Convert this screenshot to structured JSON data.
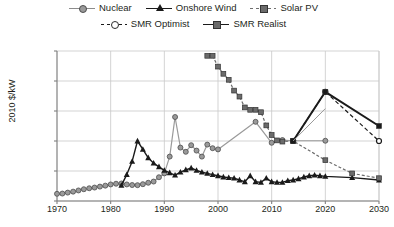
{
  "legend": {
    "rows": [
      [
        {
          "label": "Nuclear",
          "marker": "circle",
          "line": "solid-gray",
          "icon": "nuclear-series-swatch"
        },
        {
          "label": "Onshore Wind",
          "marker": "triangle",
          "line": "solid-black",
          "icon": "onshore-wind-series-swatch"
        },
        {
          "label": "Solar PV",
          "marker": "square",
          "line": "dash-gray",
          "icon": "solar-pv-series-swatch"
        }
      ],
      [
        {
          "label": "SMR Optimist",
          "marker": "circle-open",
          "line": "dash-black",
          "icon": "smr-optimist-series-swatch"
        },
        {
          "label": "SMR Realist",
          "marker": "square",
          "line": "solid-black",
          "icon": "smr-realist-series-swatch"
        }
      ]
    ]
  },
  "axes": {
    "ylabel": "2010 $/kW",
    "yticks": [
      "$0",
      "$2,500",
      "$5,000",
      "$7,500",
      "$10,000",
      "$12,500"
    ],
    "ytick_values": [
      0,
      2500,
      5000,
      7500,
      10000,
      12500
    ],
    "xticks": [
      "1970",
      "1980",
      "1990",
      "2000",
      "2010",
      "2020",
      "2030"
    ],
    "xtick_values": [
      1970,
      1980,
      1990,
      2000,
      2010,
      2020,
      2030
    ]
  },
  "colors": {
    "nuclear": "#9a9a9a",
    "onshore_wind": "#1a1a1a",
    "solar_pv": "#6b6b6b",
    "smr_optimist": "#1a1a1a",
    "smr_realist": "#1a1a1a",
    "grid": "#c8c8c8",
    "axis": "#808080",
    "text": "#231f20",
    "background": "#ffffff"
  },
  "chart_data": {
    "type": "line",
    "title": "",
    "xlabel": "",
    "ylabel": "2010 $/kW",
    "xlim": [
      1970,
      2030
    ],
    "ylim": [
      0,
      12500
    ],
    "grid": true,
    "legend_position": "top",
    "series": [
      {
        "name": "Nuclear",
        "marker": "circle",
        "style": "solid",
        "color": "#9a9a9a",
        "points": [
          [
            1970,
            600
          ],
          [
            1971,
            620
          ],
          [
            1972,
            700
          ],
          [
            1973,
            780
          ],
          [
            1974,
            880
          ],
          [
            1975,
            980
          ],
          [
            1976,
            1060
          ],
          [
            1977,
            1120
          ],
          [
            1978,
            1200
          ],
          [
            1979,
            1280
          ],
          [
            1980,
            1380
          ],
          [
            1981,
            1440
          ],
          [
            1982,
            1460
          ],
          [
            1983,
            1380
          ],
          [
            1984,
            1330
          ],
          [
            1985,
            1320
          ],
          [
            1986,
            1400
          ],
          [
            1987,
            1520
          ],
          [
            1988,
            1620
          ],
          [
            1989,
            1980
          ],
          [
            1990,
            2300
          ],
          [
            1991,
            3700
          ],
          [
            1992,
            7000
          ],
          [
            1993,
            4450
          ],
          [
            1994,
            4100
          ],
          [
            1995,
            4650
          ],
          [
            1996,
            4200
          ],
          [
            1997,
            3700
          ],
          [
            1998,
            4700
          ],
          [
            1999,
            4400
          ],
          [
            2000,
            4300
          ],
          [
            2007,
            6600
          ],
          [
            2010,
            4850
          ],
          [
            2012,
            5080
          ],
          [
            2014,
            5020
          ],
          [
            2020,
            5020
          ]
        ]
      },
      {
        "name": "Onshore Wind",
        "marker": "triangle",
        "style": "solid",
        "color": "#1a1a1a",
        "points": [
          [
            1982,
            1300
          ],
          [
            1983,
            2200
          ],
          [
            1984,
            3300
          ],
          [
            1985,
            5000
          ],
          [
            1986,
            4300
          ],
          [
            1987,
            3600
          ],
          [
            1988,
            3150
          ],
          [
            1989,
            2850
          ],
          [
            1990,
            2550
          ],
          [
            1991,
            2350
          ],
          [
            1992,
            2150
          ],
          [
            1993,
            2400
          ],
          [
            1994,
            2600
          ],
          [
            1995,
            2750
          ],
          [
            1996,
            2550
          ],
          [
            1997,
            2400
          ],
          [
            1998,
            2300
          ],
          [
            1999,
            2200
          ],
          [
            2000,
            2100
          ],
          [
            2001,
            2000
          ],
          [
            2002,
            1950
          ],
          [
            2003,
            1900
          ],
          [
            2004,
            1750
          ],
          [
            2005,
            1600
          ],
          [
            2006,
            2100
          ],
          [
            2007,
            1600
          ],
          [
            2008,
            1550
          ],
          [
            2009,
            1900
          ],
          [
            2010,
            1600
          ],
          [
            2011,
            1550
          ],
          [
            2012,
            1550
          ],
          [
            2013,
            1700
          ],
          [
            2014,
            1750
          ],
          [
            2015,
            1850
          ],
          [
            2016,
            2000
          ],
          [
            2017,
            2100
          ],
          [
            2018,
            2150
          ],
          [
            2019,
            2100
          ],
          [
            2020,
            2050
          ],
          [
            2025,
            1950
          ],
          [
            2030,
            1750
          ]
        ]
      },
      {
        "name": "Solar PV",
        "marker": "square",
        "style": "dashed",
        "color": "#6b6b6b",
        "points": [
          [
            1998,
            12100
          ],
          [
            1999,
            12100
          ],
          [
            2000,
            11200
          ],
          [
            2001,
            10600
          ],
          [
            2002,
            10100
          ],
          [
            2003,
            9200
          ],
          [
            2004,
            8700
          ],
          [
            2005,
            7800
          ],
          [
            2006,
            7600
          ],
          [
            2007,
            7600
          ],
          [
            2008,
            7400
          ],
          [
            2009,
            6300
          ],
          [
            2010,
            5500
          ],
          [
            2011,
            5050
          ],
          [
            2012,
            4950
          ],
          [
            2014,
            5000
          ],
          [
            2020,
            3400
          ],
          [
            2025,
            2300
          ],
          [
            2030,
            1900
          ]
        ]
      },
      {
        "name": "SMR Optimist",
        "marker": "circle-open",
        "style": "dashed",
        "color": "#1a1a1a",
        "points": [
          [
            2014,
            5000
          ],
          [
            2020,
            9100
          ],
          [
            2030,
            5000
          ]
        ]
      },
      {
        "name": "SMR Realist",
        "marker": "square",
        "style": "solid",
        "color": "#1a1a1a",
        "points": [
          [
            2014,
            5000
          ],
          [
            2020,
            9100
          ],
          [
            2030,
            6250
          ]
        ]
      },
      {
        "name": "SMR Connector",
        "marker": "none",
        "style": "solid",
        "color": "#9a9a9a",
        "points": [
          [
            2014,
            5000
          ],
          [
            2020,
            7700
          ]
        ]
      }
    ]
  }
}
